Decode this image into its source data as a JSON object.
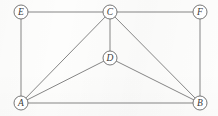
{
  "figure": {
    "kind": "undirected-graph-diagram",
    "background_color": "#fdfdfc",
    "edge_color": "#6f6f6f",
    "node_fill": "#ffffff",
    "node_stroke": "#5f5f5f",
    "label_color": "#3a3a3a",
    "node_radius": 7,
    "width": 218,
    "height": 116
  },
  "ghost_text": {
    "line_1": "",
    "line_2": "",
    "line_3": "",
    "line_4": ""
  },
  "graph_data": {
    "type": "graph",
    "directed": false,
    "node_count": 6,
    "edge_count": 10,
    "nodes": [
      {
        "id": "E",
        "label": "E",
        "x": 21,
        "y": 12,
        "degree": 2
      },
      {
        "id": "C",
        "label": "C",
        "x": 110,
        "y": 12,
        "degree": 5
      },
      {
        "id": "F",
        "label": "F",
        "x": 200,
        "y": 12,
        "degree": 2
      },
      {
        "id": "D",
        "label": "D",
        "x": 110,
        "y": 58,
        "degree": 3
      },
      {
        "id": "A",
        "label": "A",
        "x": 21,
        "y": 103,
        "degree": 4
      },
      {
        "id": "B",
        "label": "B",
        "x": 200,
        "y": 103,
        "degree": 4
      }
    ],
    "edges": [
      {
        "id": "E-C",
        "source": "E",
        "target": "C"
      },
      {
        "id": "C-F",
        "source": "C",
        "target": "F"
      },
      {
        "id": "E-A",
        "source": "E",
        "target": "A"
      },
      {
        "id": "F-B",
        "source": "F",
        "target": "B"
      },
      {
        "id": "A-B",
        "source": "A",
        "target": "B"
      },
      {
        "id": "A-C",
        "source": "A",
        "target": "C"
      },
      {
        "id": "A-D",
        "source": "A",
        "target": "D"
      },
      {
        "id": "C-D",
        "source": "C",
        "target": "D"
      },
      {
        "id": "D-B",
        "source": "D",
        "target": "B"
      },
      {
        "id": "C-B",
        "source": "C",
        "target": "B"
      }
    ]
  }
}
